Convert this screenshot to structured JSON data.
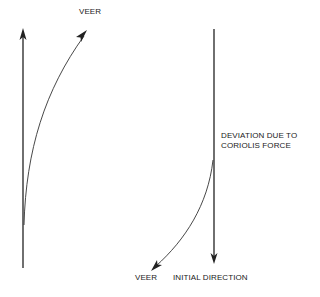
{
  "diagram": {
    "left_panel": {
      "straight_arrow": {
        "direction": "up"
      },
      "curved_arrow": {
        "direction": "up-right"
      },
      "label_veer": "VEER"
    },
    "right_panel": {
      "straight_arrow": {
        "direction": "down"
      },
      "curved_arrow": {
        "direction": "down-left"
      },
      "label_deviation_line1": "DEVIATION DUE TO",
      "label_deviation_line2": "CORIOLIS FORCE",
      "label_veer": "VEER",
      "label_initial_direction": "INITIAL DIRECTION"
    },
    "colors": {
      "line": "#222222",
      "background": "#ffffff"
    }
  }
}
